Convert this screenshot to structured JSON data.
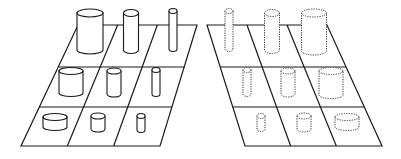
{
  "diagram": {
    "colors": {
      "background": "#ffffff",
      "stroke": "#1a1a1a"
    },
    "panels": [
      {
        "name": "left-grid",
        "style": "solid",
        "corners": {
          "top_left": [
            78,
            25
          ],
          "top_right": [
            197,
            25
          ],
          "bottom_right": [
            160,
            146
          ],
          "bottom_left": [
            21,
            146
          ]
        },
        "row_lines_y": [
          67,
          107
        ],
        "cylinders": [
          {
            "row": 0,
            "col": 0,
            "cx": 90,
            "top": 13,
            "bottom": 50,
            "rx": 13,
            "ry": 4
          },
          {
            "row": 0,
            "col": 1,
            "cx": 131,
            "top": 13,
            "bottom": 50,
            "rx": 7.5,
            "ry": 3.5
          },
          {
            "row": 0,
            "col": 2,
            "cx": 173,
            "top": 11,
            "bottom": 49,
            "rx": 4,
            "ry": 2.5
          },
          {
            "row": 1,
            "col": 0,
            "cx": 71,
            "top": 71,
            "bottom": 93,
            "rx": 12,
            "ry": 3.5
          },
          {
            "row": 1,
            "col": 1,
            "cx": 114,
            "top": 71,
            "bottom": 94,
            "rx": 7,
            "ry": 3
          },
          {
            "row": 1,
            "col": 2,
            "cx": 156,
            "top": 70,
            "bottom": 94,
            "rx": 4,
            "ry": 2.5
          },
          {
            "row": 2,
            "col": 0,
            "cx": 55,
            "top": 117,
            "bottom": 127,
            "rx": 12,
            "ry": 3.5
          },
          {
            "row": 2,
            "col": 1,
            "cx": 98,
            "top": 116,
            "bottom": 129,
            "rx": 7,
            "ry": 3
          },
          {
            "row": 2,
            "col": 2,
            "cx": 141,
            "top": 116,
            "bottom": 130,
            "rx": 4,
            "ry": 2.5
          }
        ]
      },
      {
        "name": "right-grid",
        "style": "dotted",
        "corners": {
          "top_left": [
            207,
            25
          ],
          "top_right": [
            327,
            25
          ],
          "bottom_right": [
            382,
            146
          ],
          "bottom_left": [
            245,
            146
          ]
        },
        "row_lines_y": [
          67,
          107
        ],
        "cylinders": [
          {
            "row": 0,
            "col": 0,
            "cx": 229,
            "top": 11,
            "bottom": 49,
            "rx": 4,
            "ry": 2.5
          },
          {
            "row": 0,
            "col": 1,
            "cx": 272,
            "top": 13,
            "bottom": 50,
            "rx": 7.5,
            "ry": 3.5
          },
          {
            "row": 0,
            "col": 2,
            "cx": 314,
            "top": 13,
            "bottom": 51,
            "rx": 12.5,
            "ry": 4
          },
          {
            "row": 1,
            "col": 0,
            "cx": 247,
            "top": 70,
            "bottom": 94,
            "rx": 4,
            "ry": 2.5
          },
          {
            "row": 1,
            "col": 1,
            "cx": 288,
            "top": 71,
            "bottom": 94,
            "rx": 7,
            "ry": 3
          },
          {
            "row": 1,
            "col": 2,
            "cx": 331,
            "top": 71,
            "bottom": 95,
            "rx": 12,
            "ry": 3.5
          },
          {
            "row": 2,
            "col": 0,
            "cx": 261,
            "top": 116,
            "bottom": 129,
            "rx": 4,
            "ry": 2.5
          },
          {
            "row": 2,
            "col": 1,
            "cx": 304,
            "top": 116,
            "bottom": 129,
            "rx": 7,
            "ry": 3
          },
          {
            "row": 2,
            "col": 2,
            "cx": 347,
            "top": 117,
            "bottom": 127,
            "rx": 12,
            "ry": 3.5
          }
        ]
      }
    ]
  }
}
